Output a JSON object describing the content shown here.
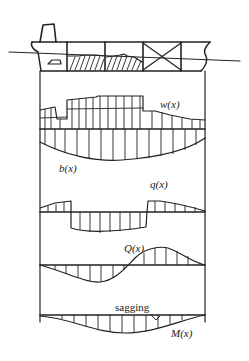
{
  "diagram": {
    "ship": {
      "holds": [
        "engine-room",
        "cargo-hold-1",
        "cargo-hold-2",
        "empty-hold-x",
        "bow-compartment"
      ],
      "waterline": true
    },
    "labels": {
      "weight": "w(x)",
      "buoyancy": "b(x)",
      "load": "q(x)",
      "shear": "Q(x)",
      "moment": "M(x)",
      "moment_note": "sagging"
    },
    "ink_color": "#222222",
    "background": "#ffffff"
  }
}
